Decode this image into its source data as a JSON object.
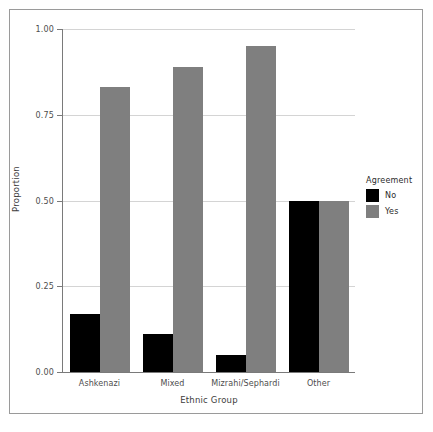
{
  "chart_data": {
    "type": "bar",
    "title": "",
    "subtitle": "",
    "xlabel": "Ethnic Group",
    "ylabel": "Proportion",
    "categories": [
      "Ashkenazi",
      "Mixed",
      "Mizrahi/Sephardi",
      "Other"
    ],
    "series": [
      {
        "name": "No",
        "color": "#000000",
        "values": [
          0.17,
          0.11,
          0.05,
          0.5
        ]
      },
      {
        "name": "Yes",
        "color": "#7f7f7f",
        "values": [
          0.83,
          0.89,
          0.95,
          0.5
        ]
      }
    ],
    "ylim": [
      0.0,
      1.0
    ],
    "y_ticks": [
      0.0,
      0.25,
      0.5,
      0.75,
      1.0
    ],
    "y_tick_labels": [
      "0.00",
      "0.25",
      "0.50",
      "0.75",
      "1.00"
    ],
    "grid": "horizontal",
    "grid_color": "#d4d4d4",
    "legend": {
      "title": "Agreement",
      "position": "right",
      "entries": [
        {
          "label": "No",
          "color": "#000000"
        },
        {
          "label": "Yes",
          "color": "#7f7f7f"
        }
      ]
    },
    "background_color": "#ffffff",
    "frame_color": "#9a9a9a",
    "axis_color": "#7a7a7a"
  }
}
